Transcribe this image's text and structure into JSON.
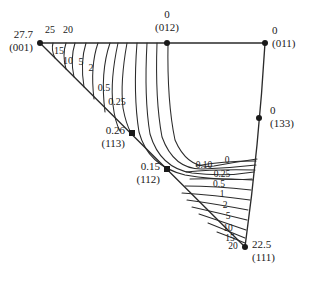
{
  "figure": {
    "type": "inverse-pole-figure",
    "background_color": "#ffffff",
    "line_color": "#2b2b2b",
    "text_color": "#1a1a1a"
  },
  "poles": [
    {
      "id": "pole-001",
      "value": "27.7",
      "index": "(001)",
      "marker": "dot",
      "x": 40,
      "y": 43,
      "value_x": 33,
      "value_y": 38,
      "index_x": 33,
      "index_y": 51,
      "anchor": "end"
    },
    {
      "id": "pole-012",
      "value": "0",
      "index": "(012)",
      "marker": "dot",
      "x": 167,
      "y": 43,
      "value_x": 167,
      "value_y": 18,
      "index_x": 167,
      "index_y": 31,
      "anchor": "middle"
    },
    {
      "id": "pole-011",
      "value": "0",
      "index": "(011)",
      "marker": "dot",
      "x": 265,
      "y": 43,
      "value_x": 272,
      "value_y": 34,
      "index_x": 272,
      "index_y": 47,
      "anchor": "start"
    },
    {
      "id": "pole-133",
      "value": "0",
      "index": "(133)",
      "marker": "dot",
      "x": 259,
      "y": 118,
      "value_x": 270,
      "value_y": 114,
      "index_x": 270,
      "index_y": 127,
      "anchor": "start"
    },
    {
      "id": "pole-111",
      "value": "22.5",
      "index": "(111)",
      "marker": "dot",
      "x": 245,
      "y": 247,
      "value_x": 252,
      "value_y": 248,
      "index_x": 252,
      "index_y": 261,
      "anchor": "start"
    },
    {
      "id": "pole-112",
      "value": "0.15",
      "index": "(112)",
      "marker": "square",
      "x": 167,
      "y": 169,
      "value_x": 160,
      "value_y": 170,
      "index_x": 160,
      "index_y": 183,
      "anchor": "end"
    },
    {
      "id": "pole-113",
      "value": "0.26",
      "index": "(113)",
      "marker": "square",
      "x": 132,
      "y": 133,
      "value_x": 125,
      "value_y": 134,
      "index_x": 125,
      "index_y": 147,
      "anchor": "end"
    }
  ],
  "contour_labels_upper_left": [
    {
      "text": "25",
      "x": 50,
      "y": 33
    },
    {
      "text": "20",
      "x": 68,
      "y": 33
    },
    {
      "text": "15",
      "x": 59,
      "y": 54
    },
    {
      "text": "10",
      "x": 68,
      "y": 64
    },
    {
      "text": "5",
      "x": 81,
      "y": 65
    },
    {
      "text": "2",
      "x": 91,
      "y": 71
    },
    {
      "text": "0.5",
      "x": 104,
      "y": 91
    },
    {
      "text": "0.25",
      "x": 117,
      "y": 105
    }
  ],
  "contour_labels_lower_right": [
    {
      "text": "0.10",
      "x": 204,
      "y": 168
    },
    {
      "text": "0",
      "x": 227,
      "y": 163
    },
    {
      "text": "0.25",
      "x": 222,
      "y": 177
    },
    {
      "text": "0.5",
      "x": 219,
      "y": 187
    },
    {
      "text": "1",
      "x": 222,
      "y": 197
    },
    {
      "text": "2",
      "x": 225,
      "y": 208
    },
    {
      "text": "5",
      "x": 228,
      "y": 219
    },
    {
      "text": "10",
      "x": 228,
      "y": 231
    },
    {
      "text": "15",
      "x": 230,
      "y": 241
    },
    {
      "text": "20",
      "x": 233,
      "y": 249
    }
  ],
  "chart_data": {
    "type": "line",
    "title": "",
    "xlabel": "",
    "ylabel": "",
    "contour_levels": [
      0,
      0.1,
      0.15,
      0.25,
      0.26,
      0.5,
      1,
      2,
      5,
      10,
      15,
      20,
      22.5,
      25,
      27.7
    ],
    "vertex_values": {
      "(001)": 27.7,
      "(011)": 0,
      "(111)": 22.5,
      "(012)": 0,
      "(133)": 0,
      "(112)": 0.15,
      "(113)": 0.26
    },
    "series": [
      {
        "name": "25",
        "values": [
          25
        ]
      },
      {
        "name": "20",
        "values": [
          20
        ]
      },
      {
        "name": "15",
        "values": [
          15
        ]
      },
      {
        "name": "10",
        "values": [
          10
        ]
      },
      {
        "name": "5",
        "values": [
          5
        ]
      },
      {
        "name": "2",
        "values": [
          2
        ]
      },
      {
        "name": "1",
        "values": [
          1
        ]
      },
      {
        "name": "0.5",
        "values": [
          0.5
        ]
      },
      {
        "name": "0.25",
        "values": [
          0.25
        ]
      },
      {
        "name": "0.10",
        "values": [
          0.1
        ]
      },
      {
        "name": "0",
        "values": [
          0
        ]
      }
    ]
  }
}
